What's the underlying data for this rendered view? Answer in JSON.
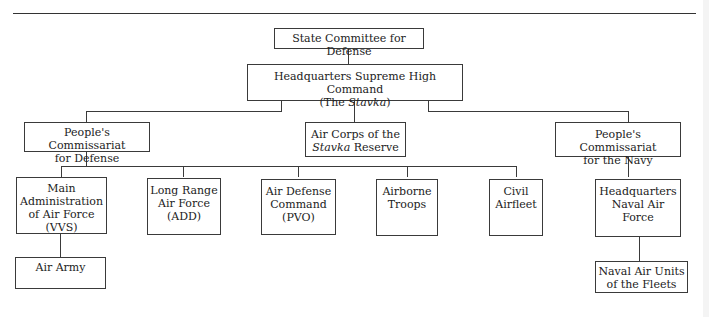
{
  "diagram": {
    "type": "org-chart",
    "nodes": {
      "gko": {
        "lines": [
          "State Committee for Defense"
        ]
      },
      "stavka": {
        "lines": [
          "Headquarters Supreme High Command"
        ],
        "sub_prefix": "(The ",
        "sub_italic": "Stavka",
        "sub_suffix": ")"
      },
      "pc_defense": {
        "lines": [
          "People's Commissariat",
          "for Defense"
        ]
      },
      "air_corps": {
        "line1": "Air Corps of the",
        "line2_italic": "Stavka",
        "line2_rest": " Reserve"
      },
      "pc_navy": {
        "lines": [
          "People's Commissariat",
          "for the Navy"
        ]
      },
      "vvs": {
        "lines": [
          "Main",
          "Administration",
          "of Air Force",
          "(VVS)"
        ]
      },
      "add": {
        "lines": [
          "Long Range",
          "Air Force",
          "(ADD)"
        ]
      },
      "pvo": {
        "lines": [
          "Air Defense",
          "Command",
          "(PVO)"
        ]
      },
      "airborne": {
        "lines": [
          "Airborne",
          "Troops"
        ]
      },
      "civil": {
        "lines": [
          "Civil",
          "Airfleet"
        ]
      },
      "naval_hq": {
        "lines": [
          "Headquarters",
          "Naval Air",
          "Force"
        ]
      },
      "air_army": {
        "lines": [
          "Air Army"
        ]
      },
      "naval_units": {
        "lines": [
          "Naval Air Units",
          "of the Fleets"
        ]
      }
    },
    "edges": [
      [
        "gko",
        "stavka"
      ],
      [
        "stavka",
        "pc_defense"
      ],
      [
        "stavka",
        "air_corps"
      ],
      [
        "stavka",
        "pc_navy"
      ],
      [
        "pc_defense",
        "vvs"
      ],
      [
        "pc_defense",
        "add"
      ],
      [
        "pc_defense",
        "pvo"
      ],
      [
        "pc_defense",
        "airborne"
      ],
      [
        "pc_defense",
        "civil"
      ],
      [
        "vvs",
        "air_army"
      ],
      [
        "pc_navy",
        "naval_hq"
      ],
      [
        "naval_hq",
        "naval_units"
      ]
    ]
  }
}
